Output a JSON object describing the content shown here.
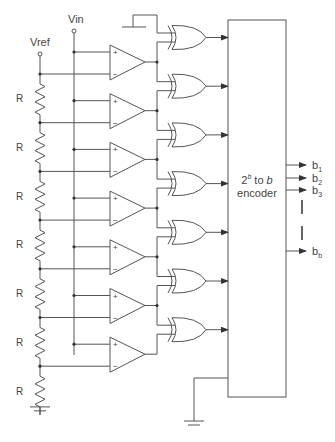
{
  "inputs": {
    "vref": "Vref",
    "vin": "Vin"
  },
  "resistor_label": "R",
  "resistors": [
    "R",
    "R",
    "R",
    "R",
    "R",
    "R",
    "R"
  ],
  "comparator_count": 7,
  "comparator_signs": {
    "plus": "+",
    "minus": "−"
  },
  "xor_count": 7,
  "encoder": {
    "line1_base": "2",
    "line1_sup": "b",
    "line1_rest": " to ",
    "line1_italic": "b",
    "line2": "encoder"
  },
  "outputs": [
    {
      "base": "b",
      "sub": "1"
    },
    {
      "base": "b",
      "sub": "2"
    },
    {
      "base": "b",
      "sub": "3"
    },
    {
      "base": "b",
      "sub": "b"
    }
  ],
  "colors": {
    "line": "#555555",
    "text": "#444444",
    "background": "#ffffff"
  }
}
